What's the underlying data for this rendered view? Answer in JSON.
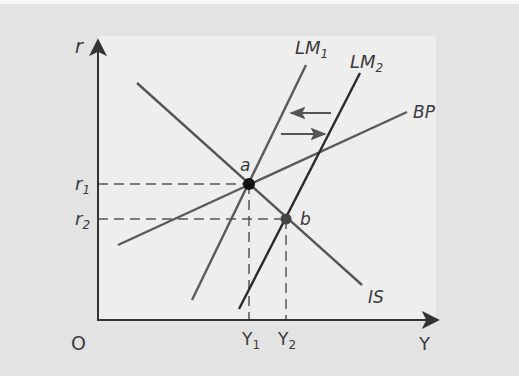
{
  "diagram": {
    "type": "IS-LM-BP",
    "axes": {
      "y_label": "r",
      "x_label": "Y",
      "origin_label": "O"
    },
    "curves": [
      {
        "id": "IS",
        "label": "IS",
        "color": "#555555"
      },
      {
        "id": "LM1",
        "label": "LM",
        "subscript": "1",
        "color": "#5a5a5a"
      },
      {
        "id": "LM2",
        "label": "LM",
        "subscript": "2",
        "color": "#2a2a2a"
      },
      {
        "id": "BP",
        "label": "BP",
        "color": "#5a5a5a"
      }
    ],
    "points": [
      {
        "id": "a",
        "label": "a",
        "r_label": "r",
        "r_sub": "1",
        "y_label": "Y",
        "y_sub": "1"
      },
      {
        "id": "b",
        "label": "b",
        "r_label": "r",
        "r_sub": "2",
        "y_label": "Y",
        "y_sub": "2"
      }
    ],
    "arrows": [
      {
        "direction": "left",
        "meaning": "LM shifts back"
      },
      {
        "direction": "right",
        "meaning": "LM shifts out"
      }
    ],
    "colors": {
      "background": "#e3e3e3",
      "panel": "#eeeeee",
      "axis": "#333333"
    }
  }
}
